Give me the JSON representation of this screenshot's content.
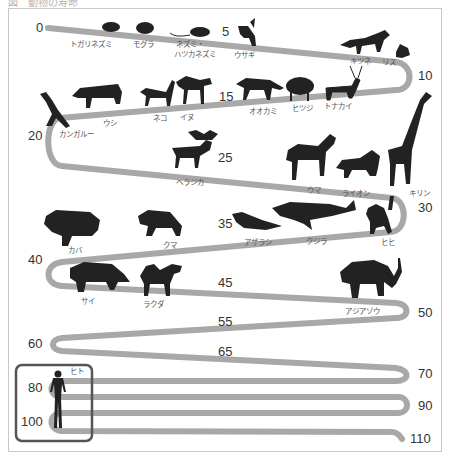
{
  "caption": "図　動物の寿命",
  "colors": {
    "path": "#a8a8a8",
    "silhouette": "#222222",
    "frame": "#c8c8c8",
    "human_box": "#555555",
    "text": "#333333"
  },
  "scale_labels": [
    {
      "value": "0",
      "x": 36,
      "y": 32
    },
    {
      "value": "5",
      "x": 222,
      "y": 36
    },
    {
      "value": "10",
      "x": 418,
      "y": 80
    },
    {
      "value": "15",
      "x": 219,
      "y": 101
    },
    {
      "value": "20",
      "x": 28,
      "y": 140
    },
    {
      "value": "25",
      "x": 218,
      "y": 162
    },
    {
      "value": "30",
      "x": 418,
      "y": 212
    },
    {
      "value": "35",
      "x": 218,
      "y": 228
    },
    {
      "value": "40",
      "x": 28,
      "y": 264
    },
    {
      "value": "45",
      "x": 218,
      "y": 287
    },
    {
      "value": "50",
      "x": 418,
      "y": 317
    },
    {
      "value": "55",
      "x": 218,
      "y": 326
    },
    {
      "value": "60",
      "x": 28,
      "y": 348
    },
    {
      "value": "65",
      "x": 218,
      "y": 356
    },
    {
      "value": "70",
      "x": 418,
      "y": 378
    },
    {
      "value": "80",
      "x": 28,
      "y": 392
    },
    {
      "value": "90",
      "x": 418,
      "y": 410
    },
    {
      "value": "100",
      "x": 21,
      "y": 426
    },
    {
      "value": "110",
      "x": 410,
      "y": 443
    }
  ],
  "animals": [
    {
      "name": "トガリネズミ",
      "lifespan": 1,
      "x": 92,
      "y": 47
    },
    {
      "name": "モグラ",
      "lifespan": 2,
      "x": 147,
      "y": 47
    },
    {
      "name": "ネズミ・",
      "name2": "ハツカネズミ",
      "lifespan": 3,
      "x": 198,
      "y": 47
    },
    {
      "name": "ウサギ",
      "lifespan": 5,
      "x": 242,
      "y": 57
    },
    {
      "name": "キツネ",
      "lifespan": 9,
      "x": 360,
      "y": 63
    },
    {
      "name": "リス",
      "lifespan": 10,
      "x": 390,
      "y": 64
    },
    {
      "name": "トナカイ",
      "lifespan": 11,
      "x": 333,
      "y": 108
    },
    {
      "name": "ヒツジ",
      "lifespan": 12,
      "x": 301,
      "y": 110
    },
    {
      "name": "オオカミ",
      "lifespan": 13,
      "x": 262,
      "y": 113
    },
    {
      "name": "イヌ",
      "lifespan": 15,
      "x": 187,
      "y": 119
    },
    {
      "name": "ネコ",
      "lifespan": 15,
      "x": 160,
      "y": 120
    },
    {
      "name": "ウシ",
      "lifespan": 19,
      "x": 110,
      "y": 125
    },
    {
      "name": "カンガルー",
      "lifespan": 20,
      "x": 78,
      "y": 134
    },
    {
      "name": "ヘラジカ",
      "lifespan": 25,
      "x": 196,
      "y": 184
    },
    {
      "name": "ウマ",
      "lifespan": 28,
      "x": 315,
      "y": 192
    },
    {
      "name": "ライオン",
      "lifespan": 29,
      "x": 359,
      "y": 195
    },
    {
      "name": "キリン",
      "lifespan": 30,
      "x": 419,
      "y": 195
    },
    {
      "name": "ヒヒ",
      "lifespan": 31,
      "x": 387,
      "y": 244
    },
    {
      "name": "クジラ",
      "lifespan": 33,
      "x": 318,
      "y": 243
    },
    {
      "name": "アザラシ",
      "lifespan": 35,
      "x": 261,
      "y": 244
    },
    {
      "name": "クマ",
      "lifespan": 37,
      "x": 170,
      "y": 247
    },
    {
      "name": "カバ",
      "lifespan": 40,
      "x": 77,
      "y": 252
    },
    {
      "name": "サイ",
      "lifespan": 41,
      "x": 88,
      "y": 303
    },
    {
      "name": "ラクダ",
      "lifespan": 43,
      "x": 153,
      "y": 306
    },
    {
      "name": "アジアゾウ",
      "lifespan": 50,
      "x": 365,
      "y": 313
    },
    {
      "name": "ヒト",
      "lifespan": 90,
      "x": 80,
      "y": 373
    }
  ]
}
